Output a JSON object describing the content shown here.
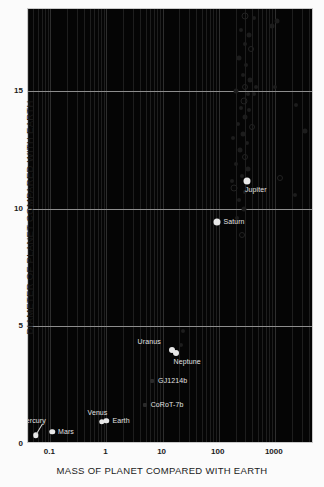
{
  "chart_data": {
    "type": "scatter",
    "title": "",
    "xlabel": "MASS OF PLANET COMPARED WITH EARTH",
    "ylabel": "DIAMETER OF  PLANET COMPARED  WITH EARTH",
    "xscale": "log",
    "yscale": "linear",
    "xlim": [
      0.04,
      5000
    ],
    "ylim": [
      0,
      18.5
    ],
    "xticks": [
      "0.1",
      "1",
      "10",
      "100",
      "1000"
    ],
    "xtick_values": [
      0.1,
      1,
      10,
      100,
      1000
    ],
    "yticks": [
      "0",
      "5",
      "10",
      "15"
    ],
    "ytick_values": [
      0,
      5,
      10,
      15
    ],
    "grid": "log minor vertical, horizontal at y ticks",
    "legend": "none",
    "series": [
      {
        "name": "Solar System planets",
        "marker": "filled white circle",
        "points": [
          {
            "label": "Mercury",
            "x": 0.055,
            "y": 0.38,
            "label_pos": "leader-up-left"
          },
          {
            "label": "Mars",
            "x": 0.107,
            "y": 0.53,
            "label_pos": "right"
          },
          {
            "label": "Venus",
            "x": 0.815,
            "y": 0.95,
            "label_pos": "above-left"
          },
          {
            "label": "Earth",
            "x": 1.0,
            "y": 1.0,
            "label_pos": "right"
          },
          {
            "label": "Uranus",
            "x": 14.5,
            "y": 4.0,
            "label_pos": "left"
          },
          {
            "label": "Neptune",
            "x": 17.1,
            "y": 3.88,
            "label_pos": "below-right"
          },
          {
            "label": "Saturn",
            "x": 95.0,
            "y": 9.45,
            "label_pos": "right"
          },
          {
            "label": "Jupiter",
            "x": 318.0,
            "y": 11.2,
            "label_pos": "below-right"
          }
        ]
      },
      {
        "name": "Labelled exoplanets",
        "marker": "small dim square",
        "points": [
          {
            "label": "GJ1214b",
            "x": 6.5,
            "y": 2.68,
            "label_pos": "right"
          },
          {
            "label": "CoRoT-7b",
            "x": 4.8,
            "y": 1.68,
            "label_pos": "right"
          }
        ]
      },
      {
        "name": "Exoplanets",
        "marker": "dim gray circle",
        "points": [
          {
            "x": 300,
            "y": 18.2
          },
          {
            "x": 420,
            "y": 18.1
          },
          {
            "x": 250,
            "y": 17.6
          },
          {
            "x": 340,
            "y": 17.4
          },
          {
            "x": 290,
            "y": 17.0
          },
          {
            "x": 380,
            "y": 16.8
          },
          {
            "x": 230,
            "y": 16.4
          },
          {
            "x": 310,
            "y": 16.1
          },
          {
            "x": 270,
            "y": 15.7
          },
          {
            "x": 360,
            "y": 15.5
          },
          {
            "x": 300,
            "y": 15.2
          },
          {
            "x": 460,
            "y": 15.2
          },
          {
            "x": 200,
            "y": 15.0
          },
          {
            "x": 330,
            "y": 14.9
          },
          {
            "x": 420,
            "y": 14.9
          },
          {
            "x": 280,
            "y": 14.6
          },
          {
            "x": 250,
            "y": 14.3
          },
          {
            "x": 350,
            "y": 14.2
          },
          {
            "x": 300,
            "y": 13.9
          },
          {
            "x": 220,
            "y": 13.6
          },
          {
            "x": 400,
            "y": 13.5
          },
          {
            "x": 270,
            "y": 13.2
          },
          {
            "x": 180,
            "y": 13.0
          },
          {
            "x": 320,
            "y": 12.8
          },
          {
            "x": 240,
            "y": 12.5
          },
          {
            "x": 290,
            "y": 12.2
          },
          {
            "x": 200,
            "y": 11.9
          },
          {
            "x": 330,
            "y": 11.7
          },
          {
            "x": 260,
            "y": 11.4
          },
          {
            "x": 170,
            "y": 11.2
          },
          {
            "x": 190,
            "y": 10.9
          },
          {
            "x": 300,
            "y": 10.7
          },
          {
            "x": 230,
            "y": 10.4
          },
          {
            "x": 280,
            "y": 10.0
          },
          {
            "x": 210,
            "y": 9.6
          },
          {
            "x": 260,
            "y": 8.9
          },
          {
            "x": 1100,
            "y": 18.0
          },
          {
            "x": 1000,
            "y": 15.2
          },
          {
            "x": 2400,
            "y": 14.4
          },
          {
            "x": 3400,
            "y": 13.3
          },
          {
            "x": 1250,
            "y": 11.3
          },
          {
            "x": 2300,
            "y": 10.6
          },
          {
            "x": 880,
            "y": 17.8
          },
          {
            "x": 23,
            "y": 4.8
          },
          {
            "x": 21,
            "y": 4.2
          }
        ]
      }
    ]
  },
  "labels": {
    "x_title": "MASS OF PLANET COMPARED WITH EARTH",
    "y_title": "DIAMETER OF  PLANET COMPARED  WITH EARTH"
  }
}
